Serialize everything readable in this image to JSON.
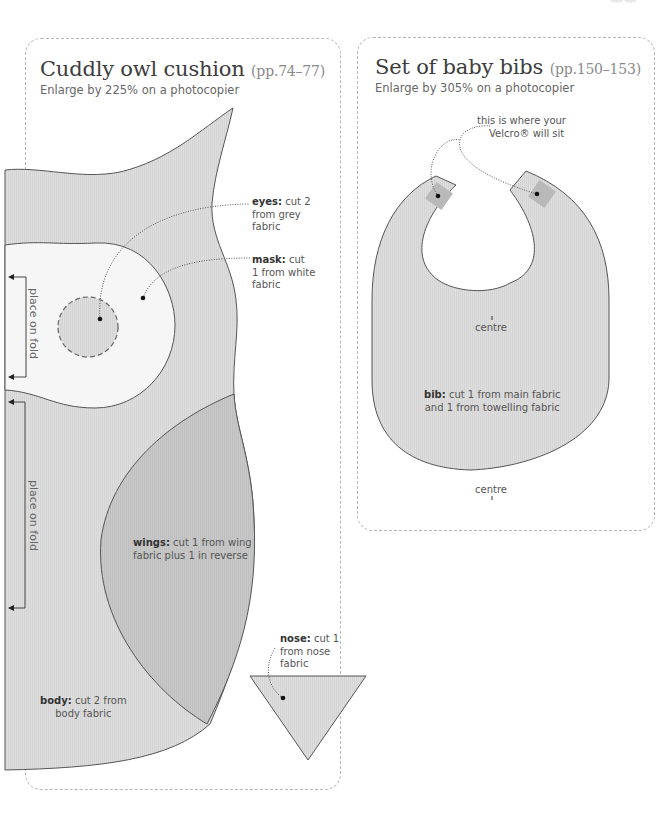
{
  "owl": {
    "title": "Cuddly owl cushion",
    "pages": "(pp.74–77)",
    "subtitle": "Enlarge by 225% on a photocopier",
    "labels": {
      "eyes_bold": "eyes:",
      "eyes_rest": " cut 2",
      "eyes_line2": "from grey",
      "eyes_line3": "fabric",
      "mask_bold": "mask:",
      "mask_rest": " cut",
      "mask_line2": "1 from white",
      "mask_line3": "fabric",
      "wings_bold": "wings:",
      "wings_rest": " cut 1 from wing",
      "wings_line2": "fabric plus 1 in reverse",
      "body_bold": "body:",
      "body_rest": " cut 2 from",
      "body_line2": "body fabric",
      "nose_bold": "nose:",
      "nose_rest": " cut 1",
      "nose_line2": "from nose",
      "nose_line3": "fabric",
      "fold_1": "place on fold",
      "fold_2": "place on fold"
    }
  },
  "bib": {
    "title": "Set of baby bibs",
    "pages": "(pp.150–153)",
    "subtitle": "Enlarge by 305% on a photocopier",
    "labels": {
      "velcro_line1": "this is where your",
      "velcro_line2": "Velcro® will sit",
      "centre_top": "centre",
      "centre_bottom": "centre",
      "bib_bold": "bib:",
      "bib_rest": " cut 1 from main fabric",
      "bib_line2": "and 1 from towelling fabric"
    }
  },
  "colors": {
    "body_fill": "#dcdcdc",
    "wing_fill": "#c6c6c6",
    "mask_fill": "#f6f6f6",
    "eye_fill": "#d8d8d8",
    "velcro_fill": "#b9b9b9",
    "outline": "#555555",
    "dashed_border": "#b8b8b8"
  }
}
